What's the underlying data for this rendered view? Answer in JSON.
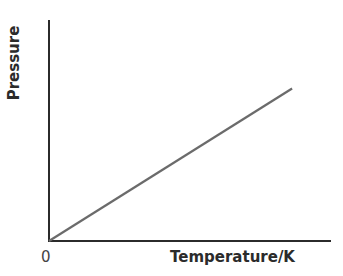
{
  "chart_data": {
    "type": "line",
    "title": "",
    "xlabel": "Temperature/K",
    "ylabel": "Pressure",
    "x_tick_labels": [
      "0"
    ],
    "y_tick_labels": [],
    "grid": false,
    "legend": null,
    "series": [
      {
        "name": "Pressure vs Temperature",
        "x": [
          0,
          1
        ],
        "y": [
          0,
          0.69
        ],
        "color": "#6b6b6b"
      }
    ],
    "xlim": [
      0,
      1.16
    ],
    "ylim": [
      0,
      1.0
    ],
    "annotations": []
  },
  "axes": {
    "origin_label": "0",
    "x_title": "Temperature/K",
    "y_title": "Pressure",
    "axis_color": "#2b2b2b",
    "line_color": "#6b6b6b"
  }
}
